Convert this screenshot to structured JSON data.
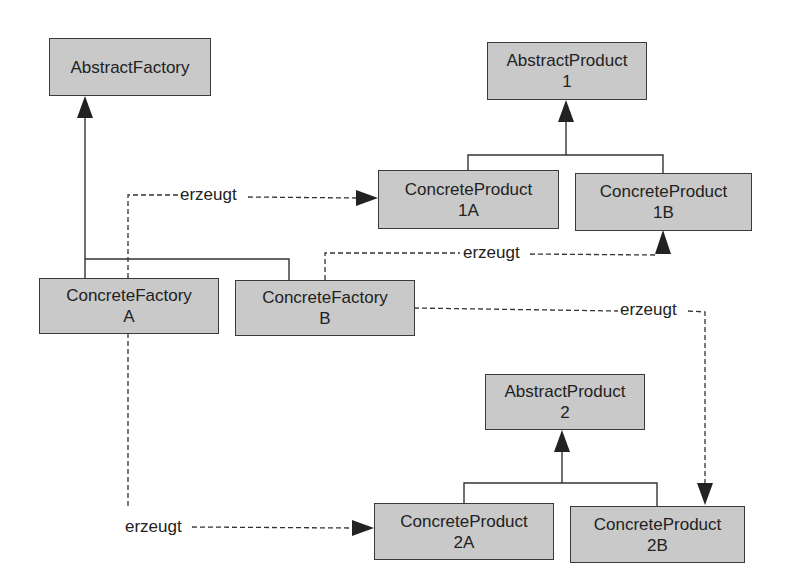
{
  "diagram": {
    "type": "UML class diagram - Abstract Factory pattern",
    "boxes": {
      "abstract_factory": {
        "line1": "AbstractFactory",
        "line2": ""
      },
      "abstract_product_1": {
        "line1": "AbstractProduct",
        "line2": "1"
      },
      "concrete_product_1a": {
        "line1": "ConcreteProduct",
        "line2": "1A"
      },
      "concrete_product_1b": {
        "line1": "ConcreteProduct",
        "line2": "1B"
      },
      "concrete_factory_a": {
        "line1": "ConcreteFactory",
        "line2": "A"
      },
      "concrete_factory_b": {
        "line1": "ConcreteFactory",
        "line2": "B"
      },
      "abstract_product_2": {
        "line1": "AbstractProduct",
        "line2": "2"
      },
      "concrete_product_2a": {
        "line1": "ConcreteProduct",
        "line2": "2A"
      },
      "concrete_product_2b": {
        "line1": "ConcreteProduct",
        "line2": "2B"
      }
    },
    "edge_labels": {
      "a_to_1a": "erzeugt",
      "b_to_1b": "erzeugt",
      "b_to_2b": "erzeugt",
      "a_to_2a": "erzeugt"
    },
    "colors": {
      "box_fill": "#c9c9c9",
      "stroke": "#3a3a3a",
      "background": "#ffffff"
    }
  }
}
